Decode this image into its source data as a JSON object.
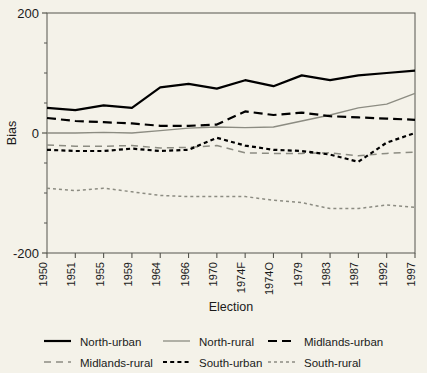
{
  "chart_data": {
    "type": "line",
    "title": "",
    "xlabel": "Election",
    "ylabel": "Bias",
    "categories": [
      "1950",
      "1951",
      "1955",
      "1959",
      "1964",
      "1966",
      "1970",
      "1974F",
      "1974O",
      "1979",
      "1983",
      "1987",
      "1992",
      "1997"
    ],
    "ylim": [
      -200,
      200
    ],
    "yticks": [
      -200,
      0,
      200
    ],
    "yticklabels": [
      "-200",
      "0",
      "200"
    ],
    "yminorticks": [
      -150,
      -100,
      -50,
      50,
      100,
      150
    ],
    "grid": false,
    "legend_position": "below",
    "series": [
      {
        "name": "North-urban",
        "style": "solid",
        "color": "#000000",
        "width": 2.2,
        "values": [
          42,
          38,
          46,
          42,
          76,
          82,
          74,
          88,
          78,
          96,
          88,
          96,
          100,
          104
        ]
      },
      {
        "name": "North-rural",
        "style": "solid",
        "color": "#8c8c82",
        "width": 1.3,
        "values": [
          0,
          0,
          1,
          0,
          4,
          8,
          10,
          9,
          10,
          20,
          30,
          42,
          48,
          66
        ]
      },
      {
        "name": "Midlands-urban",
        "style": "dashed",
        "color": "#000000",
        "width": 2.2,
        "values": [
          25,
          20,
          18,
          16,
          12,
          12,
          14,
          36,
          30,
          34,
          28,
          26,
          24,
          22
        ]
      },
      {
        "name": "Midlands-rural",
        "style": "dashed",
        "color": "#8c8c82",
        "width": 1.5,
        "values": [
          -20,
          -22,
          -22,
          -21,
          -25,
          -24,
          -21,
          -33,
          -34,
          -34,
          -33,
          -38,
          -34,
          -32
        ]
      },
      {
        "name": "South-urban",
        "style": "dotted",
        "color": "#000000",
        "width": 2.2,
        "values": [
          -28,
          -30,
          -30,
          -26,
          -30,
          -28,
          -8,
          -21,
          -28,
          -30,
          -36,
          -48,
          -16,
          0
        ]
      },
      {
        "name": "South-rural",
        "style": "dotted",
        "color": "#8c8c82",
        "width": 1.5,
        "values": [
          -92,
          -96,
          -92,
          -98,
          -104,
          -106,
          -106,
          -106,
          -112,
          -116,
          -126,
          -126,
          -120,
          -124
        ]
      }
    ]
  },
  "legend": {
    "entries": [
      {
        "label": "North-urban"
      },
      {
        "label": "North-rural"
      },
      {
        "label": "Midlands-urban"
      },
      {
        "label": "Midlands-rural"
      },
      {
        "label": "South-urban"
      },
      {
        "label": "South-rural"
      }
    ]
  }
}
